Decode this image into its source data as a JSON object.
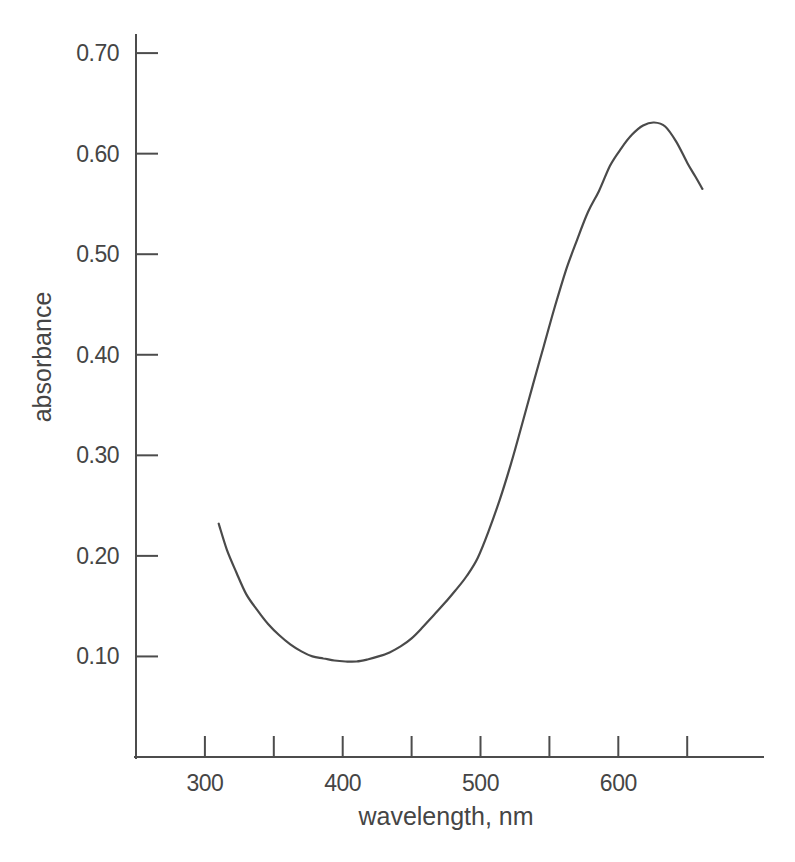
{
  "figure": {
    "background": "#ffffff"
  },
  "colors": {
    "axis": "#4c4c4c",
    "text": "#454545",
    "curve": "#4a4a4a",
    "background": "#ffffff"
  },
  "chart_data": {
    "type": "line",
    "title": "",
    "xlabel": "wavelength, nm",
    "ylabel": "absorbance",
    "xlim": [
      250,
      705
    ],
    "ylim": [
      0,
      0.718
    ],
    "grid": false,
    "legend": "none",
    "x_ticks_labeled": [
      300,
      400,
      500,
      600
    ],
    "x_ticks_unlabeled": [
      350,
      450,
      550,
      650
    ],
    "y_ticks": [
      0.7,
      0.6,
      0.5,
      0.4,
      0.3,
      0.2,
      0.1
    ],
    "y_tick_labels": [
      "0.70",
      "0.60",
      "0.50",
      "0.40",
      "0.30",
      "0.20",
      "0.10"
    ],
    "series": [
      {
        "name": "absorbance-spectrum",
        "x": [
          310,
          316,
          323,
          330,
          338,
          346,
          354,
          362,
          370,
          378,
          386,
          394,
          402,
          410,
          418,
          426,
          434,
          442,
          450,
          458,
          466,
          474,
          482,
          490,
          498,
          506,
          514,
          522,
          530,
          538,
          546,
          554,
          562,
          570,
          578,
          586,
          594,
          602,
          610,
          618,
          626,
          634,
          642,
          650,
          656,
          661
        ],
        "y": [
          0.232,
          0.206,
          0.183,
          0.162,
          0.146,
          0.132,
          0.121,
          0.112,
          0.105,
          0.1,
          0.098,
          0.096,
          0.095,
          0.095,
          0.097,
          0.1,
          0.104,
          0.11,
          0.118,
          0.129,
          0.141,
          0.153,
          0.166,
          0.18,
          0.198,
          0.225,
          0.256,
          0.291,
          0.33,
          0.37,
          0.409,
          0.448,
          0.484,
          0.514,
          0.542,
          0.563,
          0.588,
          0.605,
          0.619,
          0.628,
          0.631,
          0.627,
          0.612,
          0.591,
          0.577,
          0.565
        ],
        "minimum": {
          "x": 406,
          "y": 0.095
        },
        "maximum": {
          "x": 622,
          "y": 0.631
        }
      }
    ]
  }
}
